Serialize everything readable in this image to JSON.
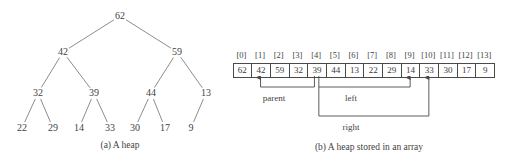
{
  "figure": {
    "panel_a": {
      "caption": "(a) A heap",
      "caption_x": 120,
      "caption_y": 146,
      "nodes": [
        {
          "label": "62",
          "x": 120,
          "y": 16,
          "level": 0,
          "index": 0
        },
        {
          "label": "42",
          "x": 63,
          "y": 52,
          "level": 1,
          "index": 1
        },
        {
          "label": "59",
          "x": 177,
          "y": 52,
          "level": 1,
          "index": 2
        },
        {
          "label": "32",
          "x": 38,
          "y": 93,
          "level": 2,
          "index": 3
        },
        {
          "label": "39",
          "x": 94,
          "y": 93,
          "level": 2,
          "index": 4
        },
        {
          "label": "44",
          "x": 151,
          "y": 93,
          "level": 2,
          "index": 5
        },
        {
          "label": "13",
          "x": 206,
          "y": 93,
          "level": 2,
          "index": 6
        },
        {
          "label": "22",
          "x": 22,
          "y": 128,
          "level": 3,
          "index": 7
        },
        {
          "label": "29",
          "x": 53,
          "y": 128,
          "level": 3,
          "index": 8
        },
        {
          "label": "14",
          "x": 79,
          "y": 128,
          "level": 3,
          "index": 9
        },
        {
          "label": "33",
          "x": 110,
          "y": 128,
          "level": 3,
          "index": 10
        },
        {
          "label": "30",
          "x": 135,
          "y": 128,
          "level": 3,
          "index": 11
        },
        {
          "label": "17",
          "x": 165,
          "y": 128,
          "level": 3,
          "index": 12
        },
        {
          "label": "9",
          "x": 191,
          "y": 128,
          "level": 3,
          "index": 13
        }
      ],
      "edges": [
        {
          "from": 0,
          "to": 1
        },
        {
          "from": 0,
          "to": 2
        },
        {
          "from": 1,
          "to": 3
        },
        {
          "from": 1,
          "to": 4
        },
        {
          "from": 2,
          "to": 5
        },
        {
          "from": 2,
          "to": 6
        },
        {
          "from": 3,
          "to": 7
        },
        {
          "from": 3,
          "to": 8
        },
        {
          "from": 4,
          "to": 9
        },
        {
          "from": 4,
          "to": 10
        },
        {
          "from": 5,
          "to": 11
        },
        {
          "from": 5,
          "to": 12
        },
        {
          "from": 6,
          "to": 13
        }
      ]
    },
    "panel_b": {
      "caption": "(b) A heap stored in an array",
      "caption_x": 137,
      "caption_y": 148,
      "indices": [
        "[0]",
        "[1]",
        "[2]",
        "[3]",
        "[4]",
        "[5]",
        "[6]",
        "[7]",
        "[8]",
        "[9]",
        "[10]",
        "[11]",
        "[12]",
        "[13]"
      ],
      "values": [
        "62",
        "42",
        "59",
        "32",
        "39",
        "44",
        "13",
        "22",
        "29",
        "14",
        "33",
        "30",
        "17",
        "9"
      ],
      "annotations": [
        {
          "name": "parent",
          "label": "parent",
          "label_x": 42,
          "label_y": 93,
          "arrow_to_index": 1,
          "source_index": 4
        },
        {
          "name": "left",
          "label": "left",
          "label_x": 119,
          "label_y": 93,
          "arrow_to_index": 9,
          "source_index": 4
        },
        {
          "name": "right",
          "label": "right",
          "label_x": 119,
          "label_y": 122,
          "arrow_to_index": 10,
          "source_index": 4
        }
      ]
    }
  },
  "colors": {
    "ink": "#3f3f3f",
    "line": "#6e6e6e",
    "cell_border": "#4a4a4a",
    "background": "#ffffff"
  }
}
